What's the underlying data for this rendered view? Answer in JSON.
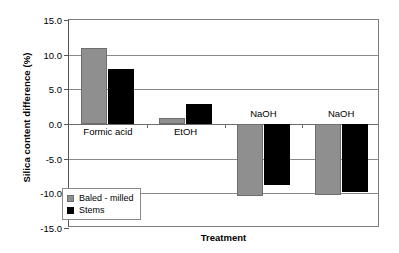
{
  "chart_data": {
    "type": "bar",
    "title": "",
    "xlabel": "Treatment",
    "ylabel": "Silica content difference (%)",
    "categories": [
      "Formic acid",
      "EtOH",
      "NaOH",
      "NaOH"
    ],
    "series": [
      {
        "name": "Baled - milled",
        "color": "#8f8f8f",
        "values": [
          11.0,
          0.8,
          -10.4,
          -10.2
        ]
      },
      {
        "name": "Stems",
        "color": "#000000",
        "values": [
          8.0,
          2.9,
          -8.8,
          -9.8
        ]
      }
    ],
    "ylim": [
      -15.0,
      15.0
    ],
    "yticks": [
      15.0,
      10.0,
      5.0,
      0.0,
      -5.0,
      -10.0,
      -15.0
    ],
    "ytick_labels": [
      "15.0",
      "10.0",
      "5.0",
      "0.0",
      "-5.0",
      "-10.0",
      "-15.0"
    ],
    "grid": true,
    "legend_position": "lower-left-inside",
    "category_labels_inside_plot": true
  }
}
